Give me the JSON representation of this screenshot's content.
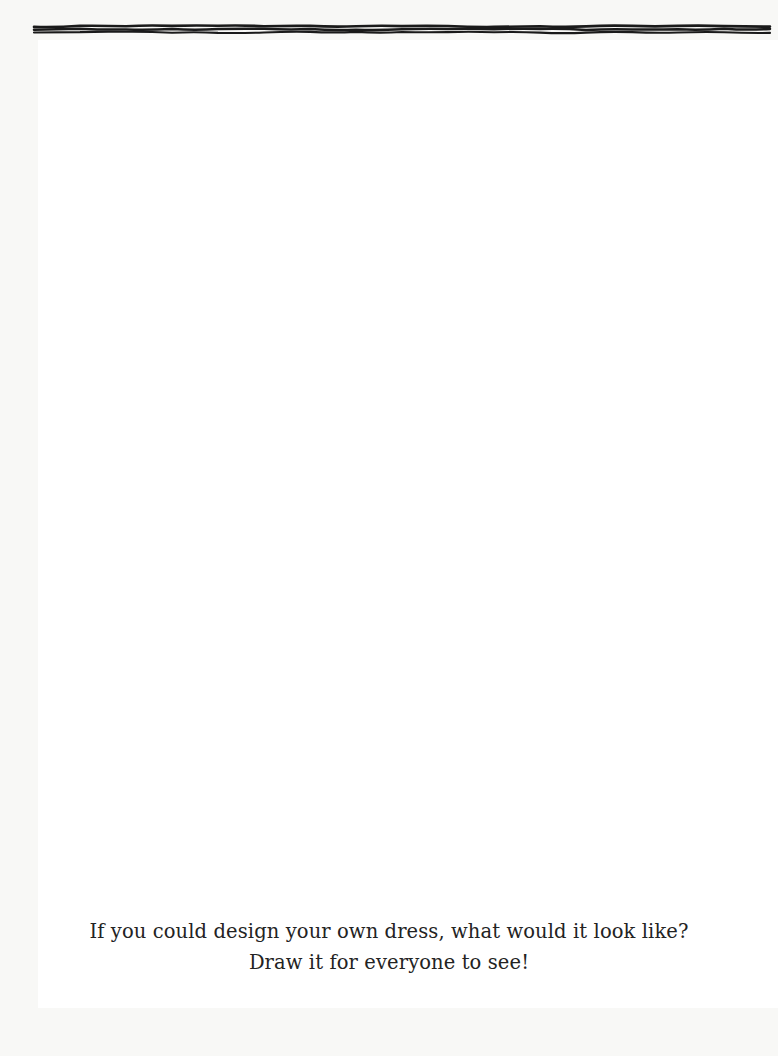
{
  "page": {
    "kind": "activity-worksheet",
    "background_color": "#f8f8f6",
    "field_color": "#ffffff",
    "ink_color": "#1a1a1a",
    "width": 778,
    "height": 1056
  },
  "prompt": {
    "line1": "If you could design your own dress, what would it look like?",
    "line2": "Draw it for everyone to see!",
    "text_color": "#232323"
  },
  "drawing_area": {
    "label": "blank drawing space"
  },
  "border": {
    "style": "hand-drawn scalloped doodle frame",
    "motifs": [
      "nested-arcs",
      "vertical-lines",
      "zigzag",
      "dots",
      "horizontal-lines"
    ],
    "top_sequence": [
      "horizontal-lines",
      "horizontal-lines",
      "vertical-lines",
      "vertical-lines",
      "zigzag",
      "zigzag",
      "horizontal-lines",
      "horizontal-lines",
      "dots",
      "dots",
      "zigzag",
      "zigzag",
      "vertical-lines",
      "vertical-lines",
      "nested-arcs",
      "nested-arcs",
      "nested-arcs"
    ],
    "right_sequence": [
      "nested-arcs",
      "vertical-lines",
      "zigzag",
      "dots",
      "horizontal-lines",
      "nested-arcs",
      "vertical-lines",
      "zigzag",
      "dots",
      "horizontal-lines",
      "nested-arcs",
      "vertical-lines",
      "zigzag",
      "dots",
      "horizontal-lines",
      "nested-arcs",
      "vertical-lines",
      "zigzag"
    ],
    "bottom_sequence": [
      "horizontal-lines",
      "horizontal-lines",
      "zigzag",
      "zigzag",
      "nested-arcs",
      "nested-arcs",
      "vertical-lines",
      "vertical-lines",
      "dots",
      "dots",
      "horizontal-lines",
      "horizontal-lines",
      "nested-arcs",
      "nested-arcs"
    ],
    "left_sequence": [
      "nested-arcs",
      "nested-arcs",
      "dots",
      "dots",
      "horizontal-lines",
      "horizontal-lines",
      "zigzag",
      "zigzag",
      "nested-arcs",
      "nested-arcs",
      "dots",
      "dots",
      "vertical-lines",
      "vertical-lines",
      "horizontal-lines",
      "horizontal-lines",
      "zigzag",
      "zigzag"
    ]
  }
}
